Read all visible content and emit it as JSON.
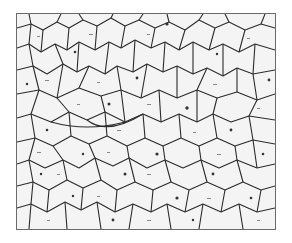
{
  "image": {
    "description": "Micrograph of polycrystalline metal showing grain boundaries",
    "background_color": "#ffffff",
    "frame_color": "#6a6a6a",
    "grain_fill": "#f4f4f4",
    "boundary_color": "#2a2a2a"
  }
}
